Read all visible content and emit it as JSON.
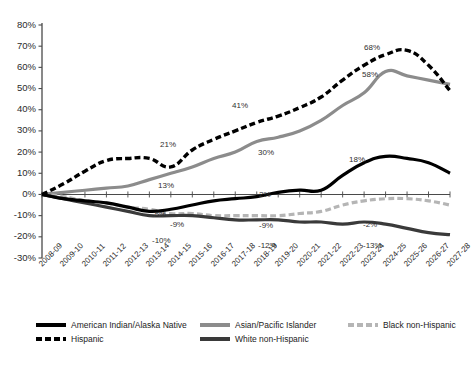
{
  "chart_data": {
    "type": "line",
    "title": "",
    "subtitle": "",
    "xlabel": "",
    "ylabel": "",
    "ylim": [
      -30,
      80
    ],
    "ytick_labels": [
      "80%",
      "70%",
      "60%",
      "50%",
      "40%",
      "30%",
      "20%",
      "10%",
      "0%",
      "-10%",
      "-20%",
      "-30%"
    ],
    "ytick_values": [
      80,
      70,
      60,
      50,
      40,
      30,
      20,
      10,
      0,
      -10,
      -20,
      -30
    ],
    "grid": false,
    "legend_position": "bottom",
    "categories": [
      "2008-09",
      "2009-10",
      "2010-11",
      "2011-12",
      "2012-13",
      "2013-14",
      "2014-15",
      "2015-16",
      "2016-17",
      "2017-18",
      "2018-19",
      "2019-20",
      "2020-21",
      "2021-22",
      "2022-23",
      "2023-24",
      "2024-25",
      "2025-26",
      "2026-27",
      "2027-28"
    ],
    "series": [
      {
        "name": "American Indian/Alaska Native",
        "style": "solid",
        "color": "#000000",
        "width": 3.2,
        "values": [
          0,
          -2,
          -3,
          -4,
          -6,
          -8,
          -7,
          -5,
          -3,
          -2,
          -1,
          1,
          2,
          2,
          9,
          15,
          18,
          17,
          15,
          10
        ]
      },
      {
        "name": "Asian/Pacific Islander",
        "style": "solid",
        "color": "#8c8c8c",
        "width": 3.2,
        "values": [
          0,
          1,
          2,
          3,
          4,
          7,
          10,
          13,
          17,
          20,
          25,
          27,
          30,
          35,
          42,
          48,
          58,
          56,
          54,
          52
        ]
      },
      {
        "name": "Black non-Hispanic",
        "style": "dashed",
        "color": "#b5b5b5",
        "width": 3.2,
        "values": [
          0,
          -1,
          -3,
          -4,
          -6,
          -7,
          -9,
          -9,
          -10,
          -10,
          -10,
          -10,
          -9,
          -8,
          -5,
          -3,
          -2,
          -2,
          -3,
          -5
        ]
      },
      {
        "name": "Hispanic",
        "style": "dashed",
        "color": "#000000",
        "width": 3.4,
        "values": [
          0,
          5,
          11,
          16,
          17,
          17,
          13,
          21,
          26,
          30,
          34,
          37,
          41,
          46,
          54,
          61,
          66,
          68,
          61,
          49
        ]
      },
      {
        "name": "White non-Hispanic",
        "style": "solid",
        "color": "#3a3a3a",
        "width": 3.2,
        "values": [
          0,
          -2,
          -4,
          -6,
          -8,
          -10,
          -10,
          -10,
          -11,
          -12,
          -12,
          -12,
          -13,
          -13,
          -14,
          -13,
          -14,
          -16,
          -18,
          -19
        ]
      }
    ],
    "point_labels": [
      {
        "text": "21%",
        "series": "Hispanic",
        "category": "2014-15",
        "x": 160,
        "y": 140
      },
      {
        "text": "41%",
        "series": "Hispanic",
        "category": "2020-21",
        "x": 232,
        "y": 101
      },
      {
        "text": "68%",
        "series": "Hispanic",
        "category": "2025-26",
        "x": 364,
        "y": 43
      },
      {
        "text": "13%",
        "series": "Asian/Pacific Islander",
        "category": "2015-16",
        "x": 158,
        "y": 181
      },
      {
        "text": "30%",
        "series": "Asian/Pacific Islander",
        "category": "2020-21",
        "x": 258,
        "y": 148
      },
      {
        "text": "58%",
        "series": "Asian/Pacific Islander",
        "category": "2024-25",
        "x": 362,
        "y": 70
      },
      {
        "text": "2%",
        "series": "American Indian/Alaska Native",
        "category": "2020-21",
        "x": 259,
        "y": 190
      },
      {
        "text": "18%",
        "series": "American Indian/Alaska Native",
        "category": "2024-25",
        "x": 349,
        "y": 155
      },
      {
        "text": "-5%",
        "series": "American Indian/Alaska Native",
        "category": "2015-16",
        "x": 152,
        "y": 210
      },
      {
        "text": "-9%",
        "series": "Black non-Hispanic",
        "category": "2016-17",
        "x": 170,
        "y": 220
      },
      {
        "text": "-9%",
        "series": "Black non-Hispanic",
        "category": "2020-21",
        "x": 259,
        "y": 221
      },
      {
        "text": "-2%",
        "series": "Black non-Hispanic",
        "category": "2024-25",
        "x": 363,
        "y": 220
      },
      {
        "text": "-10%",
        "series": "White non-Hispanic",
        "category": "2014-15",
        "x": 152,
        "y": 236
      },
      {
        "text": "-12%",
        "series": "White non-Hispanic",
        "category": "2019-20",
        "x": 258,
        "y": 241
      },
      {
        "text": "-13%",
        "series": "White non-Hispanic",
        "category": "2024-25",
        "x": 363,
        "y": 241
      }
    ]
  },
  "legend": {
    "items": [
      {
        "label": "American Indian/Alaska Native",
        "swatch": "sw-solid-black"
      },
      {
        "label": "Asian/Pacific Islander",
        "swatch": "sw-solid-midgray"
      },
      {
        "label": "Black non-Hispanic",
        "swatch": "sw-dash-litegray"
      },
      {
        "label": "Hispanic",
        "swatch": "sw-dash-black"
      },
      {
        "label": "White non-Hispanic",
        "swatch": "sw-solid-darkgray"
      }
    ]
  }
}
